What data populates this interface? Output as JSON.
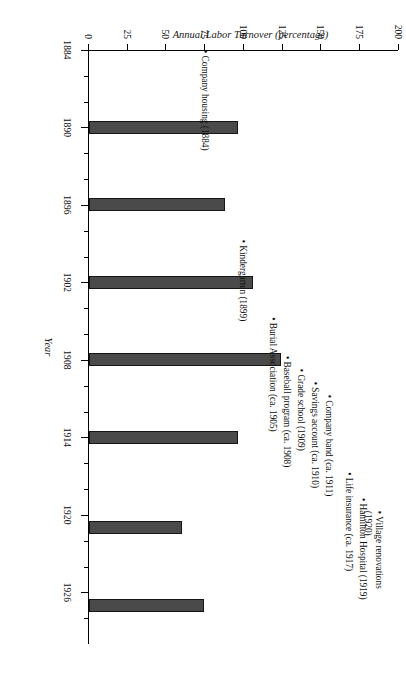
{
  "chart_data": {
    "type": "bar",
    "title": "",
    "xlabel": "Year",
    "ylabel": "Annual Labor Turnover (percentage)",
    "xlim": [
      1884,
      1930
    ],
    "ylim": [
      0,
      200
    ],
    "grid": false,
    "legend": null,
    "x_ticks_major": [
      1884,
      1890,
      1896,
      1902,
      1908,
      1914,
      1920,
      1926
    ],
    "x_ticks_minor": [
      1886,
      1888,
      1892,
      1894,
      1898,
      1900,
      1904,
      1906,
      1910,
      1912,
      1916,
      1918,
      1922,
      1924,
      1928
    ],
    "y_ticks": [
      0,
      25,
      50,
      75,
      100,
      125,
      150,
      175,
      200
    ],
    "x": [
      1890,
      1896,
      1902,
      1908,
      1914,
      1921,
      1927
    ],
    "values": [
      96,
      88,
      106,
      124,
      96,
      60,
      74
    ],
    "bar_color": "#4a4a4a",
    "annotations": [
      {
        "label": "Company housing (1884)",
        "year": 1884
      },
      {
        "label": "Kindergarten (1899)",
        "year": 1899
      },
      {
        "label": "Burial Association (ca. 1905)",
        "year": 1905
      },
      {
        "label": "Baseball program (ca. 1908)",
        "year": 1908
      },
      {
        "label": "Grade school (1909)",
        "year": 1909
      },
      {
        "label": "Savings account (ca. 1910)",
        "year": 1910
      },
      {
        "label": "Company band (ca. 1911)",
        "year": 1911
      },
      {
        "label": "Life insurance (ca. 1917)",
        "year": 1917
      },
      {
        "label": "Hamilton Hospital (1919)",
        "year": 1919
      },
      {
        "label": "Village renovations\n(1920)",
        "year": 1920
      }
    ]
  }
}
